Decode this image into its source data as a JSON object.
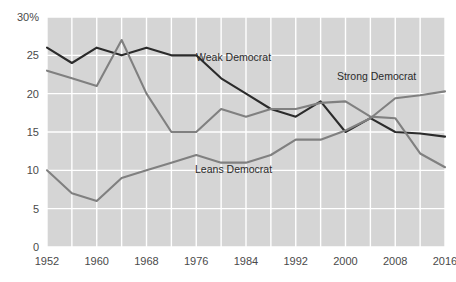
{
  "chart_data": {
    "type": "line",
    "title": "",
    "subtitle": "",
    "xlabel": "",
    "ylabel": "",
    "xlim": [
      1952,
      2016
    ],
    "ylim": [
      0,
      30
    ],
    "grid": true,
    "legend_position": "inline-annotations",
    "plot_background_color": "#d5d5d5",
    "gridline_color": "#ffffff",
    "y_ticks": [
      {
        "value": 30,
        "label": "30%"
      },
      {
        "value": 25,
        "label": "25"
      },
      {
        "value": 20,
        "label": "20"
      },
      {
        "value": 15,
        "label": "15"
      },
      {
        "value": 10,
        "label": "10"
      },
      {
        "value": 5,
        "label": "5"
      },
      {
        "value": 0,
        "label": "0"
      }
    ],
    "x_ticks": [
      {
        "value": 1952,
        "label": "1952"
      },
      {
        "value": 1960,
        "label": "1960"
      },
      {
        "value": 1968,
        "label": "1968"
      },
      {
        "value": 1976,
        "label": "1976"
      },
      {
        "value": 1984,
        "label": "1984"
      },
      {
        "value": 1992,
        "label": "1992"
      },
      {
        "value": 2000,
        "label": "2000"
      },
      {
        "value": 2008,
        "label": "2008"
      },
      {
        "value": 2016,
        "label": "2016"
      }
    ],
    "x_gridline_values": [
      1952,
      1956,
      1960,
      1964,
      1968,
      1972,
      1976,
      1980,
      1984,
      1988,
      1992,
      1996,
      2000,
      2004,
      2008,
      2012,
      2016
    ],
    "x": [
      1952,
      1956,
      1960,
      1964,
      1968,
      1972,
      1976,
      1980,
      1984,
      1988,
      1992,
      1996,
      2000,
      2004,
      2008,
      2012,
      2016
    ],
    "series": [
      {
        "name": "Weak Democrat",
        "color": "#2b2b2b",
        "values": [
          26.0,
          24.0,
          26.0,
          25.0,
          26.0,
          25.0,
          25.0,
          22.0,
          20.0,
          18.0,
          17.0,
          19.0,
          15.0,
          16.8,
          15.0,
          14.8,
          14.4
        ],
        "label_x": 1982,
        "label_y": 24.2
      },
      {
        "name": "Strong Democrat",
        "color": "#808080",
        "values": [
          23.0,
          22.0,
          21.0,
          27.0,
          20.0,
          15.0,
          15.0,
          18.0,
          17.0,
          18.0,
          18.0,
          18.8,
          19.0,
          17.0,
          16.8,
          12.2,
          10.4
        ],
        "label_x": 2005,
        "label_y": 21.8
      },
      {
        "name": "Leans Democrat",
        "color": "#808080",
        "values": [
          10.0,
          7.0,
          6.0,
          9.0,
          10.0,
          11.0,
          12.0,
          11.0,
          11.0,
          12.0,
          14.0,
          14.0,
          15.2,
          16.8,
          19.4,
          19.8,
          20.3
        ],
        "label_x": 1982,
        "label_y": 9.6
      }
    ]
  },
  "annotations": {
    "weak_democrat_label": "Weak Democrat",
    "strong_democrat_label": "Strong Democrat",
    "leans_democrat_label": "Leans Democrat"
  }
}
